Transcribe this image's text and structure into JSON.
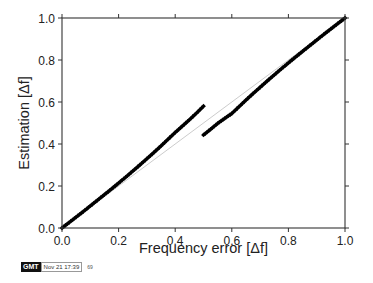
{
  "chart_data": {
    "type": "scatter",
    "title": "",
    "xlabel": "Frequency error [Δf]",
    "ylabel": "Estimation [Δf]",
    "xlim": [
      0.0,
      1.0
    ],
    "ylim": [
      0.0,
      1.0
    ],
    "x_ticks": [
      "0.0",
      "0.2",
      "0.4",
      "0.6",
      "0.8",
      "1.0"
    ],
    "y_ticks": [
      "0.0",
      "0.2",
      "0.4",
      "0.6",
      "0.8",
      "1.0"
    ],
    "grid": false,
    "legend": null,
    "reference_line": {
      "from": [
        0,
        0
      ],
      "to": [
        1,
        1
      ],
      "color": "#cccccc"
    },
    "series": [
      {
        "name": "estimate-lower-branch",
        "marker": "diamond",
        "color": "#000000",
        "x": [
          0.0,
          0.025,
          0.05,
          0.075,
          0.1,
          0.125,
          0.15,
          0.175,
          0.2,
          0.225,
          0.25,
          0.275,
          0.3,
          0.325,
          0.35,
          0.375,
          0.4,
          0.425,
          0.45,
          0.475,
          0.5
        ],
        "y": [
          0.0,
          0.026,
          0.052,
          0.078,
          0.105,
          0.132,
          0.159,
          0.186,
          0.214,
          0.242,
          0.271,
          0.3,
          0.33,
          0.36,
          0.391,
          0.423,
          0.455,
          0.485,
          0.515,
          0.547,
          0.58
        ]
      },
      {
        "name": "estimate-upper-branch",
        "marker": "diamond",
        "color": "#000000",
        "x": [
          0.5,
          0.525,
          0.55,
          0.575,
          0.6,
          0.625,
          0.65,
          0.675,
          0.7,
          0.725,
          0.75,
          0.775,
          0.8,
          0.825,
          0.85,
          0.875,
          0.9,
          0.925,
          0.95,
          0.975,
          1.0
        ],
        "y": [
          0.443,
          0.47,
          0.498,
          0.522,
          0.545,
          0.577,
          0.609,
          0.64,
          0.67,
          0.7,
          0.729,
          0.758,
          0.786,
          0.814,
          0.841,
          0.868,
          0.895,
          0.922,
          0.948,
          0.974,
          1.0
        ]
      }
    ]
  },
  "stamp": {
    "logo": "GMT",
    "timestamp": "Nov 21 17:39",
    "extra": "69"
  }
}
